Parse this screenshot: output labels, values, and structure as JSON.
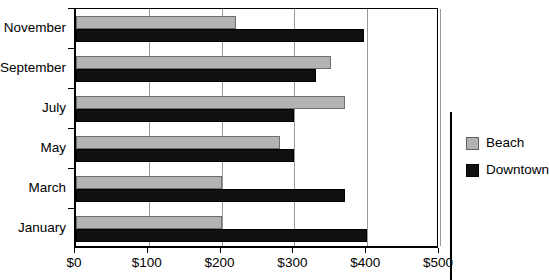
{
  "chart_data": {
    "type": "bar",
    "orientation": "horizontal",
    "title": "",
    "xlabel": "",
    "ylabel": "",
    "xlim": [
      0,
      500
    ],
    "xticks": [
      0,
      100,
      200,
      300,
      400,
      500
    ],
    "xticklabels": [
      "$0",
      "$100",
      "$200",
      "$300",
      "$400",
      "$500"
    ],
    "categories": [
      "January",
      "March",
      "May",
      "July",
      "September",
      "November"
    ],
    "grid": true,
    "legend_position": "right",
    "series": [
      {
        "name": "Beach",
        "color": "#b3b3b3",
        "values": [
          200,
          200,
          280,
          370,
          350,
          220
        ]
      },
      {
        "name": "Downtown",
        "color": "#101010",
        "values": [
          400,
          370,
          300,
          300,
          330,
          395
        ]
      }
    ]
  },
  "legend": {
    "items": [
      {
        "label": "Beach",
        "color": "#b3b3b3"
      },
      {
        "label": "Downtown",
        "color": "#101010"
      }
    ]
  }
}
